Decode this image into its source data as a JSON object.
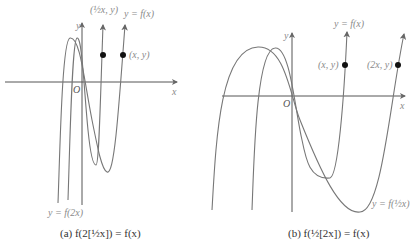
{
  "panel_a": {
    "caption": "(a) f(2[½x]) = f(x)",
    "x_axis_label": "x",
    "y_axis_label": "y",
    "origin_label": "O",
    "curve_label_original": "y = f(x)",
    "curve_label_transformed": "y = f(2x)",
    "point_original": "(x, y)",
    "point_transformed": "(½x, y)"
  },
  "panel_b": {
    "caption": "(b) f(½[2x]) = f(x)",
    "x_axis_label": "x",
    "y_axis_label": "y",
    "origin_label": "O",
    "curve_label_original": "y = f(x)",
    "curve_label_transformed": "y = f(½x)",
    "point_original": "(x, y)",
    "point_transformed": "(2x, y)"
  },
  "colors": {
    "curve": "#777777",
    "axis": "#555555",
    "point": "#111111",
    "label": "#8a8a8a"
  }
}
